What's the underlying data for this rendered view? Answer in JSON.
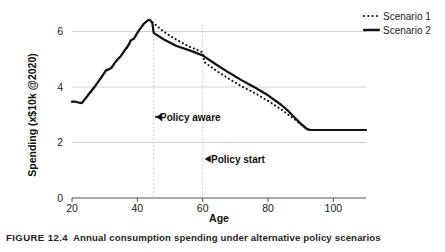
{
  "caption": {
    "figure_number": "FIGURE 12.4",
    "text": "Annual consumption spending under alternative policy scenarios"
  },
  "axes": {
    "x_title": "Age",
    "y_title": "Spending (x$10k @2020)",
    "x_ticks": [
      "20",
      "40",
      "60",
      "80",
      "100"
    ],
    "y_ticks": [
      "0",
      "2",
      "4",
      "6"
    ]
  },
  "legend": {
    "items": [
      {
        "label": "Scenario 1",
        "style": "dotted",
        "color": "#111111"
      },
      {
        "label": "Scenario 2",
        "style": "solid",
        "color": "#111111"
      }
    ]
  },
  "annotations": [
    {
      "label": "Policy aware",
      "at_age": 45
    },
    {
      "label": "Policy start",
      "at_age": 60
    }
  ],
  "chart_data": {
    "type": "line",
    "title": "Annual consumption spending under alternative policy scenarios",
    "xlabel": "Age",
    "ylabel": "Spending (x$10k @2020)",
    "xlim": [
      20,
      110
    ],
    "ylim": [
      0,
      6.9
    ],
    "xticks": [
      20,
      40,
      60,
      80,
      100
    ],
    "yticks": [
      0,
      2,
      4,
      6
    ],
    "grid": "horizontal",
    "legend_position": "top-right",
    "vertical_guides": [
      {
        "x": 45,
        "label": "Policy aware",
        "style": "dotted"
      },
      {
        "x": 60,
        "label": "Policy start",
        "style": "dotted"
      }
    ],
    "series": [
      {
        "name": "Scenario 1",
        "style": "dotted",
        "color": "#111111",
        "x": [
          20,
          21,
          22,
          23,
          25,
          27,
          29,
          30.5,
          31,
          32,
          33,
          34,
          35,
          36,
          37,
          38,
          39,
          40,
          41,
          42,
          43,
          43.5,
          44,
          44.5,
          45,
          48,
          52,
          56,
          60,
          60.5,
          64,
          68,
          72,
          76,
          80,
          84,
          86,
          88,
          90,
          92,
          93,
          96,
          100,
          105,
          110
        ],
        "y": [
          3.47,
          3.47,
          3.44,
          3.42,
          3.72,
          4.02,
          4.35,
          4.62,
          4.62,
          4.68,
          4.85,
          5.0,
          5.12,
          5.3,
          5.45,
          5.68,
          5.75,
          5.95,
          6.12,
          6.28,
          6.38,
          6.42,
          6.4,
          6.35,
          6.3,
          6.0,
          5.7,
          5.45,
          5.25,
          4.9,
          4.6,
          4.3,
          4.02,
          3.78,
          3.5,
          3.2,
          3.02,
          2.85,
          2.65,
          2.48,
          2.45,
          2.45,
          2.45,
          2.45,
          2.45
        ]
      },
      {
        "name": "Scenario 2",
        "style": "solid",
        "color": "#111111",
        "x": [
          20,
          21,
          22,
          23,
          25,
          27,
          29,
          30.5,
          31,
          32,
          33,
          34,
          35,
          36,
          37,
          38,
          39,
          40,
          41,
          42,
          43,
          43.5,
          44,
          44.6,
          45,
          48,
          52,
          56,
          60,
          64,
          68,
          72,
          76,
          80,
          84,
          86,
          88,
          90,
          92,
          93,
          96,
          100,
          105,
          110
        ],
        "y": [
          3.47,
          3.47,
          3.44,
          3.42,
          3.72,
          4.02,
          4.35,
          4.62,
          4.62,
          4.68,
          4.85,
          5.0,
          5.12,
          5.3,
          5.45,
          5.68,
          5.75,
          5.95,
          6.12,
          6.28,
          6.38,
          6.42,
          6.4,
          6.3,
          5.95,
          5.72,
          5.48,
          5.32,
          5.14,
          4.82,
          4.52,
          4.24,
          3.98,
          3.7,
          3.36,
          3.16,
          2.92,
          2.68,
          2.48,
          2.45,
          2.45,
          2.45,
          2.45,
          2.45
        ]
      }
    ]
  },
  "colors": {
    "line": "#111111",
    "grid": "#c9c9c9",
    "axis": "#4d4d4d",
    "guide": "#b8b8b8",
    "text": "#1a1a1a"
  }
}
